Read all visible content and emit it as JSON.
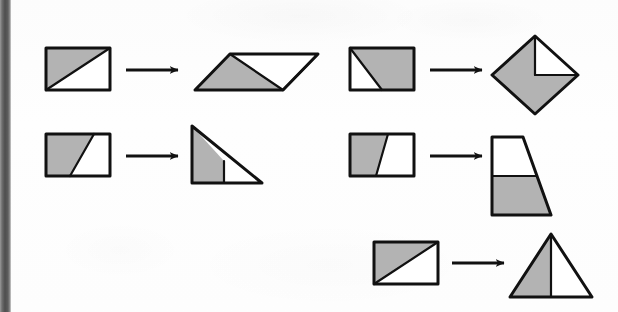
{
  "figure": {
    "description": "Five pairs of figures; each shaded rectangle is dissected and rearranged into an equal-area shape, joined by a right arrow.",
    "width": 618,
    "height": 312
  },
  "style": {
    "page_background": "#fdfdfd",
    "shade_fill": "#b3b3b3",
    "white_fill": "#ffffff",
    "outline_color": "#111111",
    "arrow_color": "#111111",
    "gutter_color": "#4e4e4e",
    "outline_width": 3,
    "inner_line_width": 2.2
  },
  "arrow_label": "transforms into",
  "transformations": [
    {
      "id": "row1-left",
      "name": "rectangle-to-parallelogram",
      "source_label": "rectangle with lower-left shaded triangle",
      "result_label": "parallelogram with shaded triangle on left",
      "source": {
        "outline": "46,48 110,48 110,90 46,90",
        "shaded": "46,48 110,48 46,90",
        "inner_lines": [
          "46,90 110,48"
        ]
      },
      "arrow": {
        "x1": 126,
        "y1": 70,
        "x2": 178,
        "y2": 70
      },
      "result": {
        "outline": "195,90 230,54 318,54 283,90",
        "shaded": "195,90 230,54 283,90",
        "inner_lines": [
          "230,54 283,90",
          "283,90 318,54"
        ]
      }
    },
    {
      "id": "row2-left",
      "name": "rectangle-to-right-triangle",
      "source_label": "rectangle with shaded trapezoid at left",
      "result_label": "right triangle with shaded left portion",
      "source": {
        "outline": "46,134 110,134 110,176 46,176",
        "shaded": "46,134 94,134 70,176 46,176",
        "inner_lines": [
          "94,134 70,176"
        ]
      },
      "arrow": {
        "x1": 126,
        "y1": 156,
        "x2": 178,
        "y2": 156
      },
      "result": {
        "outline": "192,126 192,183 262,183",
        "shaded": "192,126 192,183 224,183 224,161",
        "inner_lines": [
          "224,161 224,183"
        ]
      }
    },
    {
      "id": "row1-right",
      "name": "rectangle-to-diamond",
      "source_label": "rectangle with shaded region above diagonal",
      "result_label": "diamond with white triangle in upper-right quadrant",
      "source": {
        "outline": "350,48 414,48 414,90 350,90",
        "shaded": "350,48 414,48 414,90 382,90",
        "inner_lines": [
          "350,48 382,90"
        ]
      },
      "arrow": {
        "x1": 430,
        "y1": 70,
        "x2": 482,
        "y2": 70
      },
      "result": {
        "outline": "535,36 578,75 535,114 492,75",
        "shaded": "535,36 535,75 578,75 535,114 492,75",
        "white_parts": [
          "535,36 578,75 535,75"
        ],
        "inner_lines": [
          "535,36 535,75",
          "535,75 578,75"
        ]
      }
    },
    {
      "id": "row2-right",
      "name": "rectangle-to-trapezoid",
      "source_label": "rectangle with shaded trapezoid on the left",
      "result_label": "trapezoid with white top band and shaded lower portion",
      "source": {
        "outline": "350,134 414,134 414,176 350,176",
        "shaded": "350,134 388,134 376,176 350,176",
        "inner_lines": [
          "388,134 376,176"
        ]
      },
      "arrow": {
        "x1": 430,
        "y1": 156,
        "x2": 482,
        "y2": 156
      },
      "result": {
        "outline": "492,137 523,137 551,215 492,215",
        "shaded": "492,176 537,176 551,215 492,215",
        "white_parts": [
          "492,137 523,137 537,176 492,176"
        ],
        "inner_lines": [
          "492,176 537,176"
        ]
      }
    },
    {
      "id": "row3-right",
      "name": "rectangle-to-isosceles-triangle",
      "source_label": "rectangle with lower-left shaded triangle",
      "result_label": "isosceles triangle with shaded left half",
      "source": {
        "outline": "374,242 438,242 438,284 374,284",
        "shaded": "374,242 438,242 374,284",
        "inner_lines": [
          "374,284 438,242"
        ]
      },
      "arrow": {
        "x1": 452,
        "y1": 263,
        "x2": 504,
        "y2": 263
      },
      "result": {
        "outline": "551,234 592,297 510,297",
        "shaded": "551,234 551,297 510,297",
        "inner_lines": [
          "551,234 551,297"
        ]
      }
    }
  ]
}
